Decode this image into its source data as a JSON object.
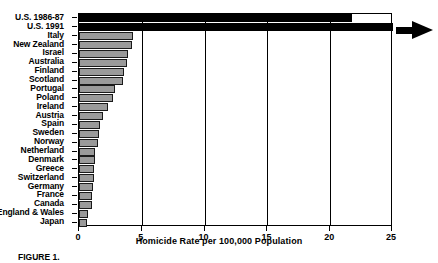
{
  "chart_data": {
    "type": "bar",
    "orientation": "horizontal",
    "title": "",
    "xlabel": "Homicide Rate per 100,000 Population",
    "ylabel": "",
    "xlim": [
      0,
      25
    ],
    "xticks": [
      0,
      5,
      10,
      15,
      20,
      25
    ],
    "xticklabels": [
      "0",
      "5",
      "10",
      "15",
      "20",
      "25"
    ],
    "grid": true,
    "categories": [
      "U.S. 1986-87",
      "U.S. 1991",
      "Italy",
      "New Zealand",
      "Israel",
      "Australia",
      "Finland",
      "Scotland",
      "Portugal",
      "Poland",
      "Ireland",
      "Austria",
      "Spain",
      "Sweden",
      "Norway",
      "Netherland",
      "Denmark",
      "Greece",
      "Switzerland",
      "Germany",
      "France",
      "Canada",
      "England & Wales",
      "Japan"
    ],
    "values": [
      21.7,
      25.0,
      4.3,
      4.2,
      3.9,
      3.8,
      3.6,
      3.5,
      2.9,
      2.7,
      2.3,
      1.9,
      1.7,
      1.6,
      1.5,
      1.3,
      1.3,
      1.2,
      1.2,
      1.1,
      1.0,
      1.0,
      0.7,
      0.6
    ],
    "value_clipped": [
      false,
      true,
      false,
      false,
      false,
      false,
      false,
      false,
      false,
      false,
      false,
      false,
      false,
      false,
      false,
      false,
      false,
      false,
      false,
      false,
      false,
      false,
      false,
      false
    ],
    "bar_colors": [
      "#000000",
      "#000000",
      "#9a9a9a",
      "#9a9a9a",
      "#9a9a9a",
      "#9a9a9a",
      "#9a9a9a",
      "#9a9a9a",
      "#9a9a9a",
      "#9a9a9a",
      "#9a9a9a",
      "#9a9a9a",
      "#9a9a9a",
      "#9a9a9a",
      "#9a9a9a",
      "#9a9a9a",
      "#9a9a9a",
      "#9a9a9a",
      "#9a9a9a",
      "#9a9a9a",
      "#9a9a9a",
      "#9a9a9a",
      "#9a9a9a",
      "#9a9a9a"
    ],
    "annotations": [
      {
        "name": "overflow-arrow",
        "target_category": "U.S. 1991",
        "meaning": "bar extends beyond axis maximum"
      }
    ],
    "colors": {
      "bar_fill": "#9a9a9a",
      "bar_edge": "#1a1a1a",
      "highlight_bar": "#000000",
      "axis": "#000000",
      "background": "#ffffff"
    }
  },
  "caption": {
    "label": "FIGURE",
    "number": "1",
    "text": ""
  }
}
